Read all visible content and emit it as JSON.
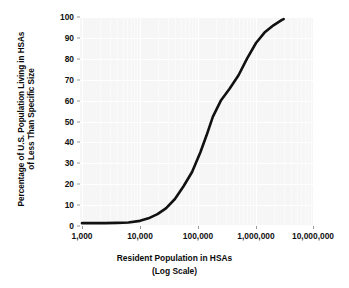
{
  "chart_data": {
    "type": "line",
    "title": "",
    "xlabel": "Resident Population in HSAs (Log Scale)",
    "xlabel_line1": "Resident Population in HSAs",
    "xlabel_line2": "(Log Scale)",
    "ylabel": "Percentage of U.S. Population Living in HSAs of Less Than Specific Size",
    "ylabel_line1": "Percentage of U.S. Population Living in HSAs",
    "ylabel_line2": "of Less Than Specific Size",
    "xscale": "log",
    "yscale": "linear",
    "xlim": [
      1000,
      10000000
    ],
    "ylim": [
      0,
      100
    ],
    "grid": true,
    "legend": null,
    "x_tick_labels": [
      "1,000",
      "10,000",
      "100,000",
      "1,000,000",
      "10,000,000"
    ],
    "x_tick_values": [
      1000,
      10000,
      100000,
      1000000,
      10000000
    ],
    "y_tick_labels": [
      "0",
      "10",
      "20",
      "30",
      "40",
      "50",
      "60",
      "70",
      "80",
      "90",
      "100"
    ],
    "y_tick_values": [
      0,
      10,
      20,
      30,
      40,
      50,
      60,
      70,
      80,
      90,
      100
    ],
    "series": [
      {
        "name": "Cumulative percentage of U.S. population",
        "color": "#111111",
        "line_width": 2.6,
        "x": [
          1000,
          1600,
          2500,
          4000,
          6300,
          10000,
          14000,
          20000,
          28000,
          40000,
          56000,
          79000,
          110000,
          140000,
          180000,
          250000,
          350000,
          500000,
          700000,
          1000000,
          1400000,
          2000000,
          2800000,
          3000000
        ],
        "y": [
          0.9,
          0.9,
          0.9,
          1.0,
          1.2,
          2.0,
          3.2,
          5.2,
          8.0,
          12.5,
          18.5,
          25.5,
          35.0,
          43.0,
          52.0,
          60.0,
          65.5,
          72.0,
          80.0,
          87.5,
          92.5,
          96.0,
          98.6,
          99.0
        ]
      }
    ]
  },
  "axis": {
    "y_title_line1": "Percentage of U.S. Population Living in HSAs",
    "y_title_line2": "of Less Than Specific Size",
    "x_title_line1": "Resident Population in HSAs",
    "x_title_line2": "(Log Scale)"
  },
  "colors": {
    "panel_background": "#f6f6f6",
    "gridline": "#ffffff",
    "curve": "#111111",
    "text": "#111111",
    "figure_background": "#ffffff"
  }
}
